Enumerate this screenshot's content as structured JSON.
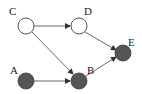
{
  "diagram": {
    "type": "directed-graph",
    "colors": {
      "filled": "#555555",
      "empty": "#ffffff",
      "stroke": "#444444",
      "edge": "#444444"
    },
    "nodes": [
      {
        "id": "A",
        "label": "A",
        "filled": true
      },
      {
        "id": "B",
        "label": "B",
        "filled": true
      },
      {
        "id": "C",
        "label": "C",
        "filled": false
      },
      {
        "id": "D",
        "label": "D",
        "filled": false
      },
      {
        "id": "E",
        "label": "E",
        "filled": true
      }
    ],
    "edges": [
      {
        "from": "C",
        "to": "D"
      },
      {
        "from": "C",
        "to": "B"
      },
      {
        "from": "A",
        "to": "B"
      },
      {
        "from": "D",
        "to": "E"
      },
      {
        "from": "B",
        "to": "E"
      }
    ]
  }
}
